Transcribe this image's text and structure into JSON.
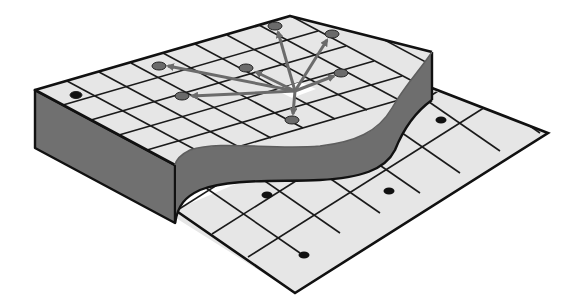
{
  "diagram": {
    "title": "Isometric terrain grid with raised plateau, curved cliff edge and flow arrows",
    "colors": {
      "background": "#ffffff",
      "grid_fill": "#e6e6e6",
      "grid_line": "#1a1a1a",
      "cliff_side": "#6e6e6e",
      "cliff_dark": "#5a5a5a",
      "arrow": "#6b6b6b",
      "upper_node": "#6a6a6a",
      "lower_node": "#111111",
      "center_highlight": "#ffffff"
    },
    "upper_plane": {
      "corners": {
        "back": [
          290,
          16
        ],
        "left": [
          35,
          90
        ],
        "front": [
          175,
          165
        ],
        "right": [
          432,
          52
        ]
      },
      "thickness": 58,
      "nodes": [
        {
          "id": "n-top",
          "x": 275,
          "y": 26
        },
        {
          "id": "n-topright",
          "x": 332,
          "y": 34
        },
        {
          "id": "n-left",
          "x": 159,
          "y": 66
        },
        {
          "id": "n-mid",
          "x": 246,
          "y": 68
        },
        {
          "id": "n-right",
          "x": 341,
          "y": 73
        },
        {
          "id": "n-lowleft",
          "x": 182,
          "y": 96
        },
        {
          "id": "n-bottom",
          "x": 292,
          "y": 120
        },
        {
          "id": "n-far-left",
          "x": 76,
          "y": 95
        }
      ],
      "source": {
        "x": 295,
        "y": 91
      },
      "arrows_to": [
        "n-top",
        "n-topright",
        "n-left",
        "n-mid",
        "n-right",
        "n-lowleft",
        "n-bottom"
      ]
    },
    "lower_plane": {
      "corners": {
        "front": [
          295,
          293
        ],
        "right": [
          548,
          133
        ]
      },
      "nodes": [
        {
          "id": "l-1",
          "x": 441,
          "y": 120
        },
        {
          "id": "l-2",
          "x": 267,
          "y": 195
        },
        {
          "id": "l-3",
          "x": 389,
          "y": 191
        },
        {
          "id": "l-4",
          "x": 304,
          "y": 255
        }
      ]
    }
  }
}
